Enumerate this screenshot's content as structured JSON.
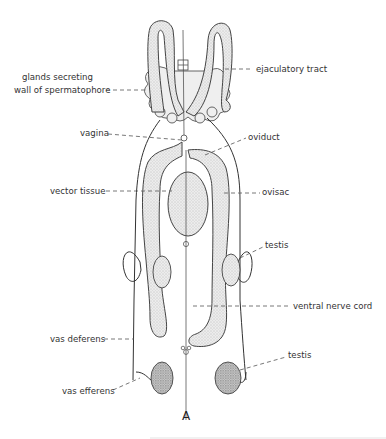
{
  "figure": {
    "caption": "A",
    "type": "anatomical line drawing",
    "labels": {
      "glands_line1": "glands secreting",
      "glands_line2": "wall of spermatophore",
      "ejaculatory_tract": "ejaculatory tract",
      "vagina": "vagina",
      "oviduct": "oviduct",
      "vector_tissue": "vector tissue",
      "ovisac": "ovisac",
      "testis_upper": "testis",
      "ventral_nerve_cord": "ventral nerve cord",
      "vas_deferens": "vas deferens",
      "vas_efferens": "vas efferens",
      "testis_lower": "testis"
    },
    "colors": {
      "background": "#ffffff",
      "ink": "#333333",
      "stipple_fill": "#e4e4e4",
      "testis_fill": "#bdbdbd"
    }
  }
}
